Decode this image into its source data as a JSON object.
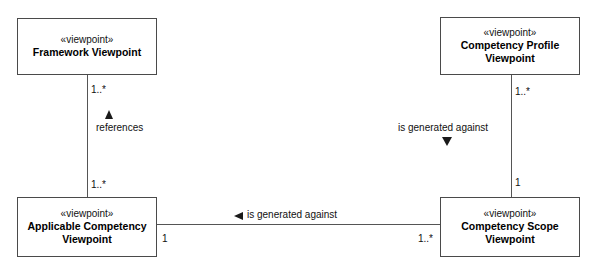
{
  "diagram": {
    "type": "uml-class-diagram",
    "nodes": [
      {
        "id": "framework-viewpoint",
        "stereotype": "«viewpoint»",
        "name_line1": "Framework Viewpoint",
        "name_line2": ""
      },
      {
        "id": "competency-profile-viewpoint",
        "stereotype": "«viewpoint»",
        "name_line1": "Competency Profile",
        "name_line2": "Viewpoint"
      },
      {
        "id": "applicable-competency-viewpoint",
        "stereotype": "«viewpoint»",
        "name_line1": "Applicable Competency",
        "name_line2": "Viewpoint"
      },
      {
        "id": "competency-scope-viewpoint",
        "stereotype": "«viewpoint»",
        "name_line1": "Competency Scope",
        "name_line2": "Viewpoint"
      }
    ],
    "edges": [
      {
        "id": "references",
        "label": "references",
        "direction_marker": "triangle-up",
        "source_multiplicity": "1..*",
        "target_multiplicity": "1..*"
      },
      {
        "id": "profile-generated-against-scope",
        "label": "is generated against",
        "direction_marker": "triangle-down",
        "source_multiplicity": "1..*",
        "target_multiplicity": "1"
      },
      {
        "id": "applicable-generated-against-scope",
        "label": "is generated against",
        "direction_marker": "triangle-left",
        "source_multiplicity": "1",
        "target_multiplicity": "1..*"
      }
    ],
    "colors": {
      "background": "#ffffff",
      "node_border": "#4a4a4a",
      "edge_line": "#555555",
      "marker": "#1a1a1a",
      "text": "#111111"
    }
  }
}
